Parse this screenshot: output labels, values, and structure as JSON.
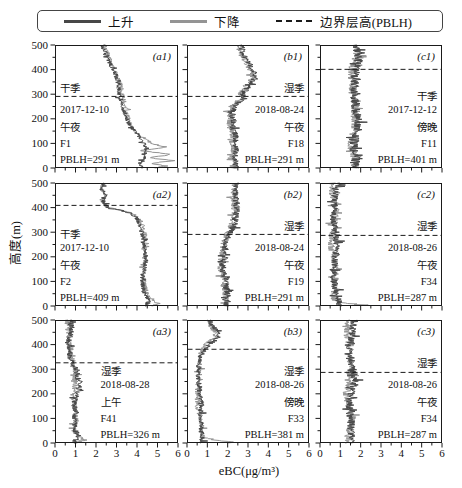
{
  "figure": {
    "legend": {
      "ascend": "上升",
      "descend": "下降",
      "pblh": "边界层高(PBLH)"
    },
    "x_axis": {
      "label": "eBC(μg/m³)",
      "ticks": [
        "0",
        "1",
        "2",
        "3",
        "4",
        "5",
        "6"
      ]
    },
    "y_axis": {
      "label": "高度(m)",
      "ticks": [
        "0",
        "100",
        "200",
        "300",
        "400",
        "500"
      ]
    }
  },
  "colors": {
    "ascend": "#474747",
    "descend": "#949494",
    "dash": "#1a1a1a",
    "frame": "#1a1a1a",
    "text": "#111111"
  },
  "chart_data": {
    "type": "line",
    "title": "",
    "xlabel": "eBC(μg/m³)",
    "ylabel": "高度(m)",
    "xlim": [
      0,
      6
    ],
    "ylim": [
      0,
      500
    ],
    "legend": [
      "上升",
      "下降",
      "边界层高(PBLH)"
    ],
    "panels": [
      {
        "id": "a1",
        "row": 0,
        "col": 0,
        "label": "(a1)",
        "season": "干季",
        "date": "2017-12-10",
        "time": "午夜",
        "flight": "F1",
        "pblh_label": "PBLH=291 m",
        "pblh_m": 291,
        "align": "left",
        "noise": 0.11,
        "ascent": [
          [
            500,
            2.35
          ],
          [
            460,
            2.55
          ],
          [
            420,
            2.7
          ],
          [
            380,
            2.9
          ],
          [
            340,
            3.05
          ],
          [
            300,
            3.15
          ],
          [
            260,
            3.3
          ],
          [
            220,
            3.45
          ],
          [
            180,
            3.6
          ],
          [
            150,
            3.85
          ],
          [
            120,
            4.15
          ],
          [
            100,
            4.3
          ],
          [
            80,
            4.45
          ],
          [
            60,
            4.3
          ],
          [
            40,
            4.35
          ],
          [
            20,
            4.2
          ],
          [
            0,
            4.3
          ]
        ],
        "descent": [
          [
            500,
            2.45
          ],
          [
            460,
            2.65
          ],
          [
            420,
            2.8
          ],
          [
            380,
            3.0
          ],
          [
            340,
            3.15
          ],
          [
            300,
            3.25
          ],
          [
            260,
            3.4
          ],
          [
            220,
            3.55
          ],
          [
            180,
            3.7
          ],
          [
            150,
            3.95
          ],
          [
            120,
            4.35
          ],
          [
            100,
            4.7
          ],
          [
            85,
            5.35
          ],
          [
            70,
            4.15
          ],
          [
            55,
            5.65
          ],
          [
            42,
            4.5
          ],
          [
            30,
            5.75
          ],
          [
            18,
            4.6
          ],
          [
            8,
            5.4
          ],
          [
            0,
            4.9
          ]
        ]
      },
      {
        "id": "b1",
        "row": 0,
        "col": 1,
        "label": "(b1)",
        "season": "湿季",
        "date": "2018-08-24",
        "time": "午夜",
        "flight": "F18",
        "pblh_label": "PBLH=291 m",
        "pblh_m": 291,
        "align": "right",
        "noise": 0.16,
        "ascent": [
          [
            500,
            2.7
          ],
          [
            475,
            2.8
          ],
          [
            450,
            2.95
          ],
          [
            425,
            3.1
          ],
          [
            400,
            3.25
          ],
          [
            375,
            3.3
          ],
          [
            350,
            3.15
          ],
          [
            325,
            2.85
          ],
          [
            300,
            2.7
          ],
          [
            285,
            2.8
          ],
          [
            270,
            2.6
          ],
          [
            250,
            2.4
          ],
          [
            225,
            2.3
          ],
          [
            200,
            2.35
          ],
          [
            175,
            2.25
          ],
          [
            150,
            2.3
          ],
          [
            125,
            2.35
          ],
          [
            100,
            2.25
          ],
          [
            75,
            2.35
          ],
          [
            50,
            2.3
          ],
          [
            25,
            2.45
          ],
          [
            0,
            2.4
          ]
        ],
        "descent_delta": -0.12
      },
      {
        "id": "c1",
        "row": 0,
        "col": 2,
        "label": "(c1)",
        "season": "干季",
        "date": "2017-12-12",
        "time": "傍晚",
        "flight": "F11",
        "pblh_label": "PBLH=401 m",
        "pblh_m": 401,
        "align": "right",
        "noise": 0.22,
        "ascent": [
          [
            500,
            1.7
          ],
          [
            450,
            1.8
          ],
          [
            400,
            1.72
          ],
          [
            350,
            1.82
          ],
          [
            300,
            1.76
          ],
          [
            250,
            1.7
          ],
          [
            200,
            1.78
          ],
          [
            150,
            1.84
          ],
          [
            100,
            1.76
          ],
          [
            50,
            1.82
          ],
          [
            0,
            1.78
          ]
        ],
        "descent_delta": -0.1
      },
      {
        "id": "a2",
        "row": 1,
        "col": 0,
        "label": "(a2)",
        "season": "干季",
        "date": "2017-12-10",
        "time": "午夜",
        "flight": "F2",
        "pblh_label": "PBLH=409 m",
        "pblh_m": 409,
        "align": "left",
        "noise": 0.11,
        "ascent": [
          [
            500,
            2.3
          ],
          [
            475,
            2.2
          ],
          [
            450,
            2.45
          ],
          [
            430,
            2.3
          ],
          [
            415,
            2.4
          ],
          [
            400,
            2.6
          ],
          [
            388,
            3.3
          ],
          [
            375,
            3.75
          ],
          [
            360,
            4.0
          ],
          [
            340,
            4.15
          ],
          [
            310,
            4.25
          ],
          [
            280,
            4.3
          ],
          [
            250,
            4.3
          ],
          [
            220,
            4.35
          ],
          [
            190,
            4.4
          ],
          [
            160,
            4.38
          ],
          [
            130,
            4.32
          ],
          [
            100,
            4.3
          ],
          [
            70,
            4.35
          ],
          [
            40,
            4.45
          ],
          [
            20,
            4.6
          ],
          [
            0,
            4.4
          ]
        ],
        "descent": [
          [
            500,
            2.35
          ],
          [
            475,
            2.25
          ],
          [
            450,
            2.5
          ],
          [
            430,
            2.35
          ],
          [
            415,
            2.45
          ],
          [
            400,
            2.65
          ],
          [
            388,
            3.35
          ],
          [
            375,
            3.8
          ],
          [
            360,
            4.05
          ],
          [
            340,
            4.2
          ],
          [
            310,
            4.3
          ],
          [
            280,
            4.35
          ],
          [
            250,
            4.35
          ],
          [
            220,
            4.4
          ],
          [
            190,
            4.45
          ],
          [
            160,
            4.42
          ],
          [
            130,
            4.36
          ],
          [
            100,
            4.35
          ],
          [
            70,
            4.4
          ],
          [
            40,
            4.5
          ],
          [
            20,
            4.75
          ],
          [
            8,
            4.95
          ],
          [
            0,
            4.6
          ]
        ]
      },
      {
        "id": "b2",
        "row": 1,
        "col": 1,
        "label": "(b2)",
        "season": "湿季",
        "date": "2018-08-24",
        "time": "午夜",
        "flight": "F19",
        "pblh_label": "PBLH=291 m",
        "pblh_m": 291,
        "align": "right",
        "noise": 0.17,
        "ascent": [
          [
            500,
            2.4
          ],
          [
            460,
            2.48
          ],
          [
            420,
            2.52
          ],
          [
            380,
            2.45
          ],
          [
            340,
            2.3
          ],
          [
            310,
            2.1
          ],
          [
            290,
            2.0
          ],
          [
            260,
            1.9
          ],
          [
            230,
            1.88
          ],
          [
            200,
            1.95
          ],
          [
            170,
            1.85
          ],
          [
            140,
            1.8
          ],
          [
            110,
            1.9
          ],
          [
            80,
            1.85
          ],
          [
            50,
            1.9
          ],
          [
            25,
            1.95
          ],
          [
            0,
            1.9
          ]
        ],
        "descent_delta": -0.1
      },
      {
        "id": "c2",
        "row": 1,
        "col": 2,
        "label": "(c2)",
        "season": "湿季",
        "date": "2018-08-26",
        "time": "午夜",
        "flight": "F34",
        "pblh_label": "PBLH=287 m",
        "pblh_m": 287,
        "align": "right",
        "noise": 0.18,
        "ascent": [
          [
            500,
            0.78
          ],
          [
            450,
            0.72
          ],
          [
            400,
            0.78
          ],
          [
            350,
            0.72
          ],
          [
            300,
            0.76
          ],
          [
            250,
            0.7
          ],
          [
            200,
            0.76
          ],
          [
            150,
            0.72
          ],
          [
            100,
            0.76
          ],
          [
            50,
            0.8
          ],
          [
            0,
            0.85
          ]
        ],
        "descent": [
          [
            500,
            0.68
          ],
          [
            450,
            0.64
          ],
          [
            400,
            0.7
          ],
          [
            350,
            0.64
          ],
          [
            300,
            0.68
          ],
          [
            250,
            0.62
          ],
          [
            200,
            0.68
          ],
          [
            150,
            0.64
          ],
          [
            100,
            0.68
          ],
          [
            50,
            0.72
          ],
          [
            20,
            0.8
          ],
          [
            10,
            1.6
          ],
          [
            4,
            2.3
          ],
          [
            0,
            2.2
          ]
        ]
      },
      {
        "id": "a3",
        "row": 2,
        "col": 0,
        "label": "(a3)",
        "season": "湿季",
        "date": "2018-08-28",
        "time": "上午",
        "flight": "F41",
        "pblh_label": "PBLH=326 m",
        "pblh_m": 326,
        "align": "indent",
        "noise": 0.14,
        "ascent": [
          [
            500,
            0.72
          ],
          [
            460,
            0.76
          ],
          [
            420,
            0.7
          ],
          [
            380,
            0.76
          ],
          [
            345,
            0.82
          ],
          [
            325,
            0.92
          ],
          [
            305,
            1.05
          ],
          [
            285,
            1.12
          ],
          [
            265,
            1.05
          ],
          [
            245,
            1.18
          ],
          [
            225,
            1.1
          ],
          [
            205,
            1.02
          ],
          [
            185,
            0.98
          ],
          [
            165,
            0.94
          ],
          [
            145,
            1.0
          ],
          [
            125,
            1.06
          ],
          [
            105,
            1.0
          ],
          [
            85,
            1.04
          ],
          [
            65,
            0.98
          ],
          [
            45,
            1.04
          ],
          [
            25,
            1.12
          ],
          [
            10,
            0.95
          ],
          [
            0,
            0.9
          ]
        ],
        "descent": [
          [
            500,
            0.66
          ],
          [
            460,
            0.7
          ],
          [
            420,
            0.64
          ],
          [
            380,
            0.7
          ],
          [
            345,
            0.76
          ],
          [
            325,
            0.86
          ],
          [
            305,
            0.98
          ],
          [
            285,
            1.05
          ],
          [
            265,
            0.98
          ],
          [
            245,
            1.1
          ],
          [
            225,
            1.03
          ],
          [
            205,
            0.95
          ],
          [
            185,
            0.9
          ],
          [
            165,
            0.87
          ],
          [
            145,
            0.93
          ],
          [
            125,
            0.99
          ],
          [
            105,
            0.93
          ],
          [
            85,
            0.97
          ],
          [
            65,
            0.91
          ],
          [
            45,
            0.97
          ],
          [
            25,
            1.28
          ],
          [
            12,
            1.5
          ],
          [
            0,
            1.0
          ]
        ]
      },
      {
        "id": "b3",
        "row": 2,
        "col": 1,
        "label": "(b3)",
        "season": "湿季",
        "date": "2018-08-26",
        "time": "傍晚",
        "flight": "F33",
        "pblh_label": "PBLH=381 m",
        "pblh_m": 381,
        "align": "right",
        "noise": 0.13,
        "ascent": [
          [
            500,
            1.15
          ],
          [
            480,
            1.25
          ],
          [
            460,
            1.45
          ],
          [
            445,
            1.6
          ],
          [
            430,
            1.5
          ],
          [
            415,
            1.3
          ],
          [
            400,
            1.05
          ],
          [
            385,
            0.85
          ],
          [
            370,
            0.72
          ],
          [
            350,
            0.65
          ],
          [
            320,
            0.6
          ],
          [
            290,
            0.64
          ],
          [
            260,
            0.6
          ],
          [
            230,
            0.66
          ],
          [
            200,
            0.6
          ],
          [
            170,
            0.64
          ],
          [
            140,
            0.6
          ],
          [
            110,
            0.66
          ],
          [
            80,
            0.7
          ],
          [
            50,
            0.74
          ],
          [
            25,
            0.8
          ],
          [
            0,
            0.82
          ]
        ],
        "descent": [
          [
            500,
            1.05
          ],
          [
            480,
            1.15
          ],
          [
            460,
            1.35
          ],
          [
            445,
            1.5
          ],
          [
            430,
            1.4
          ],
          [
            415,
            1.2
          ],
          [
            400,
            0.95
          ],
          [
            385,
            0.78
          ],
          [
            370,
            0.65
          ],
          [
            350,
            0.58
          ],
          [
            320,
            0.54
          ],
          [
            290,
            0.58
          ],
          [
            260,
            0.54
          ],
          [
            230,
            0.6
          ],
          [
            200,
            0.54
          ],
          [
            170,
            0.58
          ],
          [
            140,
            0.54
          ],
          [
            110,
            0.6
          ],
          [
            80,
            0.64
          ],
          [
            50,
            0.68
          ],
          [
            25,
            0.74
          ],
          [
            10,
            1.5
          ],
          [
            4,
            2.3
          ],
          [
            0,
            2.2
          ]
        ]
      },
      {
        "id": "c3",
        "row": 2,
        "col": 2,
        "label": "(c3)",
        "season": "湿季",
        "date": "2018-08-26",
        "time": "午夜",
        "flight": "F34",
        "pblh_label": "PBLH=287 m",
        "pblh_m": 287,
        "align": "right",
        "noise": 0.2,
        "ascent": [
          [
            500,
            1.6
          ],
          [
            450,
            1.54
          ],
          [
            400,
            1.6
          ],
          [
            350,
            1.5
          ],
          [
            300,
            1.56
          ],
          [
            250,
            1.62
          ],
          [
            200,
            1.5
          ],
          [
            150,
            1.56
          ],
          [
            100,
            1.6
          ],
          [
            50,
            1.5
          ],
          [
            0,
            1.56
          ]
        ],
        "descent_delta": -0.1
      }
    ]
  }
}
